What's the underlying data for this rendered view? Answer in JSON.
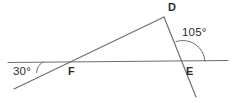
{
  "figure": {
    "type": "plane-geometry-diagram",
    "background_color": "#ffffff",
    "stroke_color": "#6e6e6e",
    "text_color": "#2b2b2b"
  },
  "points": {
    "D": {
      "label": "D",
      "x": 164,
      "y": 17
    },
    "E": {
      "label": "E",
      "x": 183,
      "y": 62
    },
    "F": {
      "label": "F",
      "x": 67,
      "y": 62
    }
  },
  "angles": {
    "left": {
      "label": "30°",
      "value": 30,
      "unit": "degrees",
      "vertex_x": 30,
      "vertex_y": 75
    },
    "right": {
      "label": "105°",
      "value": 105,
      "unit": "degrees",
      "vertex_x": 183,
      "vertex_y": 62
    }
  },
  "lines": {
    "horizontal": {
      "name": "horizontal-transversal",
      "x1": 8,
      "y1": 62.5,
      "x2": 228,
      "y2": 60.5
    },
    "slant_through_F": {
      "name": "slanted-ray-through-F-to-D",
      "x1": 14,
      "y1": 89,
      "x2": 164,
      "y2": 17
    },
    "segment_DE": {
      "name": "segment-D-through-E-extended",
      "x1": 164,
      "y1": 17,
      "x2": 196,
      "y2": 97
    }
  },
  "arcs": {
    "arc30": {
      "name": "angle-arc-30",
      "path": "M 43 61.9 A 13 13 0 0 0 36.6 72.6"
    },
    "arc105": {
      "name": "angle-arc-105",
      "path": "M 205 61.3 A 22 22 0 0 0 175.8 41.6"
    }
  }
}
